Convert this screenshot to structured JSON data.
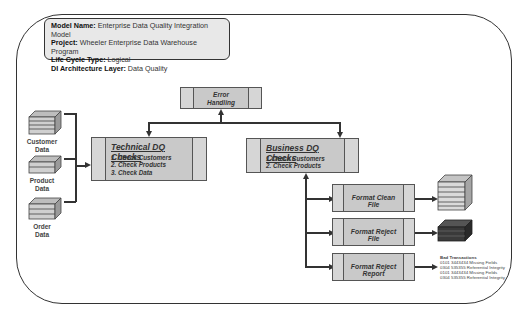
{
  "info_box": {
    "model_name_label": "Model Name:",
    "model_name": "Enterprise Data Quality Integration Model",
    "project_label": "Project:",
    "project": "Wheeler Enterprise Data Warehouse Program",
    "life_cycle_label": "Life Cycle Type:",
    "life_cycle": "Logical",
    "layer_label": "DI Architecture Layer:",
    "layer": "Data Quality"
  },
  "sources": [
    {
      "line1": "Customer",
      "line2": "Data"
    },
    {
      "line1": "Product",
      "line2": "Data"
    },
    {
      "line1": "Order",
      "line2": "Data"
    }
  ],
  "error_handling": {
    "line1": "Error",
    "line2": "Handling"
  },
  "technical_dq": {
    "title": "Technical  DQ Checks",
    "items": [
      "1. Check Customers",
      "2. Check Products",
      "3. Check Data"
    ]
  },
  "business_dq": {
    "title": "Business DQ Checks",
    "items": [
      "1.Check Customers",
      "2. Check Products"
    ]
  },
  "outputs": [
    {
      "label": "Format Clean File"
    },
    {
      "label": "Format Reject File"
    },
    {
      "label": "Format Reject Report"
    }
  ],
  "report": {
    "title": "Bad Transactions",
    "lines": [
      "0101 3443434 Missing Fields",
      "0304 535355 Referential Integrity",
      "0101 3443434 Missing Fields",
      "0304 535355 Referential Integrity"
    ]
  },
  "colors": {
    "process_fill": "#c9c9c9",
    "clean_file": "#d4d4d4",
    "reject_file": "#3a3a3a",
    "stroke": "#333333"
  }
}
